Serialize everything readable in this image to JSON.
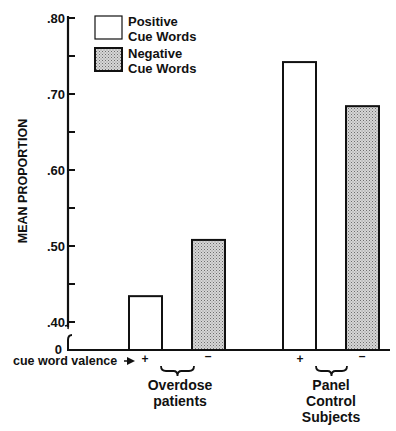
{
  "chart_data": {
    "type": "bar",
    "title": "",
    "xlabel": "cue word valence",
    "ylabel": "MEAN PROPORTION",
    "ylim": [
      0.4,
      0.8
    ],
    "axis_break": true,
    "baseline_label": "0",
    "yticks": [
      {
        "value": 0.8,
        "label": ".80"
      },
      {
        "value": 0.75,
        "label": ""
      },
      {
        "value": 0.7,
        "label": ".70"
      },
      {
        "value": 0.65,
        "label": ""
      },
      {
        "value": 0.6,
        "label": ".60"
      },
      {
        "value": 0.55,
        "label": ""
      },
      {
        "value": 0.5,
        "label": ".50"
      },
      {
        "value": 0.45,
        "label": ""
      },
      {
        "value": 0.4,
        "label": ".40"
      }
    ],
    "grid": false,
    "legend_position": "top-left-inside",
    "categories": [
      "Overdose patients",
      "Panel Control Subjects"
    ],
    "category_lines": [
      [
        "Overdose",
        "patients"
      ],
      [
        "Panel",
        "Control",
        "Subjects"
      ]
    ],
    "valence_marks": {
      "positive": "+",
      "negative": "–"
    },
    "series": [
      {
        "name": "Positive Cue Words",
        "legend_lines": [
          "Positive",
          "Cue Words"
        ],
        "fill": "#ffffff",
        "pattern": "none",
        "values": [
          0.434,
          0.742
        ]
      },
      {
        "name": "Negative Cue Words",
        "legend_lines": [
          "Negative",
          "Cue Words"
        ],
        "fill": "#bdbdbd",
        "pattern": "stipple",
        "values": [
          0.508,
          0.684
        ]
      }
    ]
  }
}
